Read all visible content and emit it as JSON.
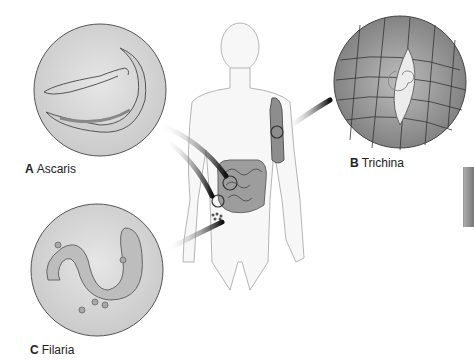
{
  "figure": {
    "panels": [
      {
        "letter": "A",
        "name": "Ascaris"
      },
      {
        "letter": "B",
        "name": "Trichina"
      },
      {
        "letter": "C",
        "name": "Filaria"
      }
    ]
  },
  "colors": {
    "circle_fill": "#d8d8d8",
    "circle_stroke": "#555555",
    "body_outline": "#aaaaaa",
    "arrow": "#111111",
    "muscle": "#9a9a9a"
  }
}
